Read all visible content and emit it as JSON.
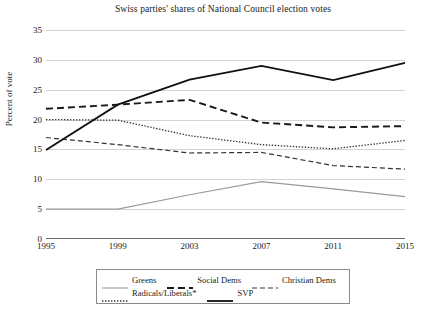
{
  "chart_data": {
    "type": "line",
    "title": "Swiss parties' shares of National Council election votes",
    "xlabel": "",
    "ylabel": "Percent of vote",
    "categories": [
      "1995",
      "1999",
      "2003",
      "2007",
      "2011",
      "2015"
    ],
    "x": [
      1995,
      1999,
      2003,
      2007,
      2011,
      2015
    ],
    "ylim": [
      0,
      35
    ],
    "yticks": [
      0,
      5,
      10,
      15,
      20,
      25,
      30,
      35
    ],
    "grid": true,
    "legend_position": "bottom",
    "series": [
      {
        "name": "Greens",
        "values": [
          5.0,
          5.0,
          7.4,
          9.6,
          8.4,
          7.1
        ],
        "color": "#9a9a9a",
        "style": "solid"
      },
      {
        "name": "Social Dems",
        "values": [
          21.8,
          22.5,
          23.3,
          19.5,
          18.7,
          18.9
        ],
        "color": "#1a1a1a",
        "style": "dashed-bold"
      },
      {
        "name": "Christian Dems",
        "values": [
          17.0,
          15.8,
          14.4,
          14.5,
          12.3,
          11.7
        ],
        "color": "#333333",
        "style": "dashed"
      },
      {
        "name": "Radicals/Liberals*",
        "values": [
          20.0,
          19.9,
          17.3,
          15.8,
          15.1,
          16.5
        ],
        "color": "#333333",
        "style": "dotted"
      },
      {
        "name": "SVP",
        "values": [
          14.9,
          22.5,
          26.7,
          29.0,
          26.6,
          29.5
        ],
        "color": "#111111",
        "style": "solid-bold"
      }
    ]
  }
}
